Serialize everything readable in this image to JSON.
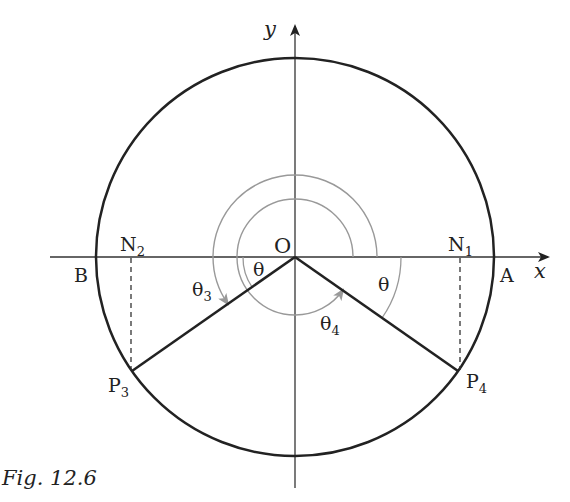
{
  "figure": {
    "caption": "Fig. 12.6",
    "axes": {
      "x_label": "x",
      "y_label": "y"
    },
    "points": {
      "origin": "O",
      "A": "A",
      "B": "B",
      "N1": "N",
      "N1_sub": "1",
      "N2": "N",
      "N2_sub": "2",
      "P3": "P",
      "P3_sub": "3",
      "P4": "P",
      "P4_sub": "4"
    },
    "angles": {
      "theta_left": "θ",
      "theta_right": "θ",
      "theta3": "θ",
      "theta3_sub": "3",
      "theta4": "θ",
      "theta4_sub": "4"
    },
    "colors": {
      "line": "#222222",
      "arc": "#999999"
    }
  }
}
